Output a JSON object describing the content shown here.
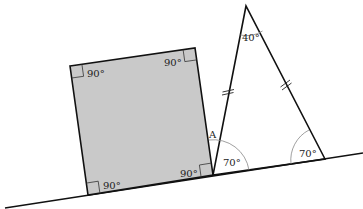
{
  "diagram": {
    "type": "geometry",
    "colors": {
      "square_fill": "#c9c9c9",
      "stroke": "#111111",
      "arc": "#888888",
      "background": "#ffffff"
    },
    "ground_line": {
      "from": [
        5,
        208
      ],
      "to": [
        363,
        153
      ]
    },
    "square": {
      "vertices": [
        [
          70,
          66
        ],
        [
          195,
          48
        ],
        [
          213,
          175
        ],
        [
          88,
          195
        ]
      ],
      "corner_labels": [
        "90°",
        "90°",
        "90°",
        "90°"
      ]
    },
    "triangle": {
      "vertices": {
        "apex": [
          246,
          6
        ],
        "base_left": [
          213,
          175
        ],
        "base_right": [
          325,
          159
        ]
      },
      "angle_labels": {
        "apex": "40°",
        "base_left": "70°",
        "base_right": "70°"
      },
      "equal_side_marks": "double tick on both slanted sides"
    },
    "point_labels": {
      "A": "A"
    }
  }
}
